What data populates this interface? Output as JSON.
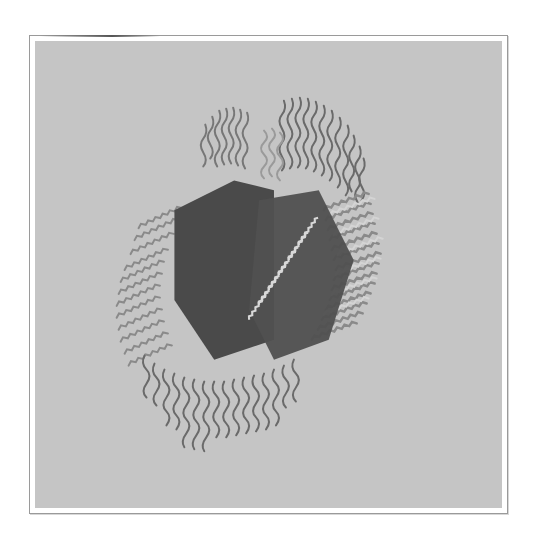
{
  "artwork": {
    "description": "Abstract grayscale artwork: two dark overlapping hexagonal/pentagonal planes surrounded by radiating fringes of zig-zag wavy ribbons on a flat light gray ground",
    "colors": {
      "page_background": "#ffffff",
      "mat_border": "#9a9a9a",
      "ground": "#c5c5c5",
      "dark_plane": "#4a4a4a",
      "dark_plane_alt": "#555555",
      "ribbon_light": "#d2d2d2",
      "ribbon_mid": "#8c8c8c",
      "ribbon_dark": "#5c5c5c"
    }
  }
}
